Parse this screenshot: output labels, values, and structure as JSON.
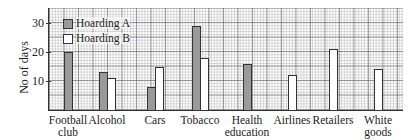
{
  "chart_data": {
    "type": "bar",
    "title": "",
    "xlabel": "",
    "ylabel": "No of days",
    "ylim": [
      0,
      35
    ],
    "yticks": [
      10,
      20,
      30
    ],
    "grid": true,
    "legend_position": "upper-left",
    "categories": [
      "Football club",
      "Alcohol",
      "Cars",
      "Tobacco",
      "Health education",
      "Airlines",
      "Retailers",
      "White goods"
    ],
    "category_lines": [
      [
        "Football",
        "club"
      ],
      [
        "Alcohol",
        ""
      ],
      [
        "Cars",
        ""
      ],
      [
        "Tobacco",
        ""
      ],
      [
        "Health",
        "education"
      ],
      [
        "Airlines",
        ""
      ],
      [
        "Retailers",
        ""
      ],
      [
        "White",
        "goods"
      ]
    ],
    "series": [
      {
        "name": "Hoarding A",
        "color": "#9a9a9a",
        "values": [
          20,
          13,
          8,
          29,
          16,
          null,
          null,
          null
        ]
      },
      {
        "name": "Hoarding B",
        "color": "#ffffff",
        "values": [
          null,
          11,
          15,
          18,
          null,
          12,
          21,
          14
        ]
      }
    ]
  },
  "legend": {
    "a_label": "Hoarding A",
    "b_label": "Hoarding B"
  },
  "axis": {
    "ylabel": "No of days",
    "ticks": [
      "10",
      "20",
      "30"
    ]
  }
}
